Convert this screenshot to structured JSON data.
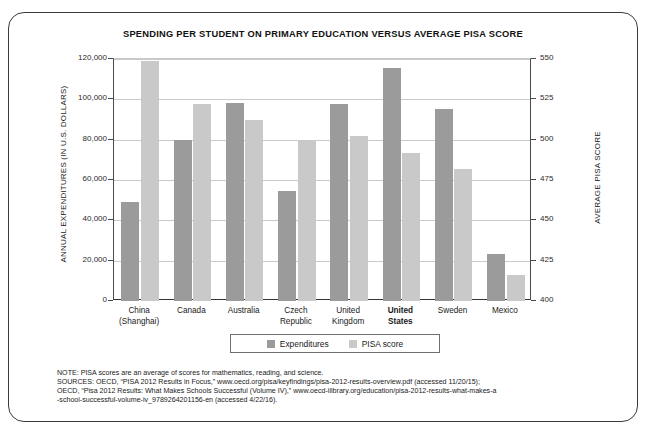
{
  "chart_data": {
    "type": "bar",
    "title": "SPENDING PER STUDENT ON PRIMARY EDUCATION  VERSUS AVERAGE PISA SCORE",
    "categories": [
      "China\n(Shanghai)",
      "Canada",
      "Australia",
      "Czech\nRepublic",
      "United\nKingdom",
      "United\nStates",
      "Sweden",
      "Mexico"
    ],
    "category_lines": [
      [
        "China",
        "(Shanghai)"
      ],
      [
        "Canada",
        ""
      ],
      [
        "Australia",
        ""
      ],
      [
        "Czech",
        "Republic"
      ],
      [
        "United",
        "Kingdom"
      ],
      [
        "United",
        "States"
      ],
      [
        "Sweden",
        ""
      ],
      [
        "Mexico",
        ""
      ]
    ],
    "highlighted_category": "United States",
    "series": [
      {
        "name": "Expenditures",
        "axis": "left",
        "color": "#9b9b9b",
        "values": [
          49000,
          80000,
          98000,
          54500,
          97500,
          115500,
          95000,
          23500
        ]
      },
      {
        "name": "PISA score",
        "axis": "right",
        "color": "#c9c9c9",
        "values": [
          549,
          522,
          512,
          500,
          502,
          492,
          482,
          416
        ]
      }
    ],
    "xlabel": "",
    "ylabel": "ANNUAL EXPENDITURES (IN U.S. DOLLARS)",
    "y2label": "AVERAGE PISA SCORE",
    "ylim": [
      0,
      120000
    ],
    "y2lim": [
      400,
      550
    ],
    "yticks": [
      0,
      20000,
      40000,
      60000,
      80000,
      100000,
      120000
    ],
    "ytick_labels": [
      "0",
      "20,000",
      "40,000",
      "60,000",
      "80,000",
      "100,000",
      "120,000"
    ],
    "y2ticks": [
      400,
      425,
      450,
      475,
      500,
      525,
      550
    ],
    "y2tick_labels": [
      "400",
      "425",
      "450",
      "475",
      "500",
      "525",
      "550"
    ],
    "grid": true,
    "legend_position": "bottom-center",
    "legend": [
      "Expenditures",
      "PISA score"
    ]
  },
  "notes": {
    "line1": "NOTE: PISA scores are an average of scores for mathematics, reading, and science.",
    "line2": "SOURCES: OECD, “PISA 2012 Results in Focus,” www.oecd.org/pisa/keyfindings/pisa-2012-results-overview.pdf (accessed 11/20/15);",
    "line3": "OECD, “Pisa 2012 Results: What Makes Schools Successful (Volume IV),” www.oecd-ilibrary.org/education/pisa-2012-results-what-makes-a",
    "line4": "-school-successful-volume-iv_9789264201156-en (accessed 4/22/16)."
  },
  "colors": {
    "expenditures": "#9b9b9b",
    "pisa": "#c9c9c9",
    "axis": "#333333",
    "grid": "#c9c9c9",
    "border": "#3b3b3b"
  }
}
